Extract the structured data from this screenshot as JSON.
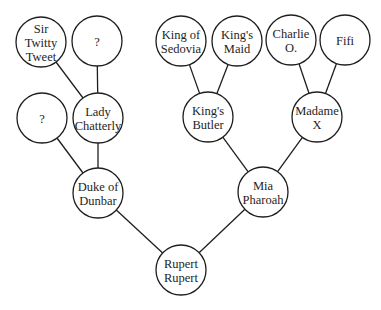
{
  "diagram": {
    "type": "family-tree",
    "colors": {
      "stroke": "#1e1e1e",
      "fill": "#ffffff",
      "text": "#1e1e1e"
    },
    "node_radius": 25,
    "nodes": [
      {
        "id": "sir-twitty-tweet",
        "lines": [
          "Sir",
          "Twitty",
          "Tweet"
        ],
        "cx": 41,
        "cy": 42
      },
      {
        "id": "unknown-top",
        "lines": [
          "?"
        ],
        "cx": 97,
        "cy": 41
      },
      {
        "id": "unknown-left",
        "lines": [
          "?"
        ],
        "cx": 42,
        "cy": 118
      },
      {
        "id": "lady-chatterly",
        "lines": [
          "Lady",
          "Chatterly"
        ],
        "cx": 98,
        "cy": 118
      },
      {
        "id": "duke-of-dunbar",
        "lines": [
          "Duke of",
          "Dunbar"
        ],
        "cx": 98,
        "cy": 193
      },
      {
        "id": "king-of-sedovia",
        "lines": [
          "King of",
          "Sedovia"
        ],
        "cx": 181,
        "cy": 41
      },
      {
        "id": "kings-maid",
        "lines": [
          "King's",
          "Maid"
        ],
        "cx": 237,
        "cy": 41
      },
      {
        "id": "charlie-o",
        "lines": [
          "Charlie",
          "O."
        ],
        "cx": 291,
        "cy": 40
      },
      {
        "id": "fifi",
        "lines": [
          "Fifi"
        ],
        "cx": 345,
        "cy": 40
      },
      {
        "id": "kings-butler",
        "lines": [
          "King's",
          "Butler"
        ],
        "cx": 208,
        "cy": 117
      },
      {
        "id": "madame-x",
        "lines": [
          "Madame",
          "X"
        ],
        "cx": 317,
        "cy": 117
      },
      {
        "id": "mia-pharoah",
        "lines": [
          "Mia",
          "Pharoah"
        ],
        "cx": 263,
        "cy": 192
      },
      {
        "id": "rupert-rupert",
        "lines": [
          "Rupert",
          "Rupert"
        ],
        "cx": 181,
        "cy": 270
      }
    ],
    "edges": [
      {
        "from": "sir-twitty-tweet",
        "to": "lady-chatterly"
      },
      {
        "from": "unknown-top",
        "to": "lady-chatterly"
      },
      {
        "from": "unknown-left",
        "to": "duke-of-dunbar"
      },
      {
        "from": "lady-chatterly",
        "to": "duke-of-dunbar"
      },
      {
        "from": "king-of-sedovia",
        "to": "kings-butler"
      },
      {
        "from": "kings-maid",
        "to": "kings-butler"
      },
      {
        "from": "charlie-o",
        "to": "madame-x"
      },
      {
        "from": "fifi",
        "to": "madame-x"
      },
      {
        "from": "kings-butler",
        "to": "mia-pharoah"
      },
      {
        "from": "madame-x",
        "to": "mia-pharoah"
      },
      {
        "from": "duke-of-dunbar",
        "to": "rupert-rupert"
      },
      {
        "from": "mia-pharoah",
        "to": "rupert-rupert"
      }
    ]
  }
}
